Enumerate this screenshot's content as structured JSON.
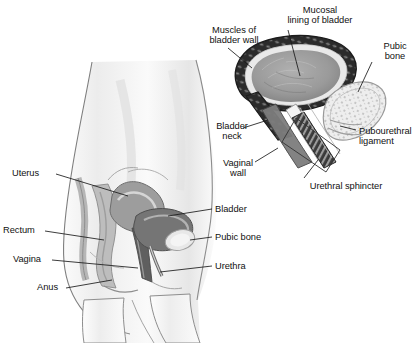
{
  "figure": {
    "background_color": "#ffffff",
    "label_color": "#111111",
    "leader_line_color": "#1a1a1a"
  },
  "main_diagram": {
    "name": "sagittal-female-pelvis",
    "description": "Side view of female torso showing pelvic organs in sagittal section",
    "labels_left": [
      {
        "id": "uterus",
        "text": "Uterus",
        "x": 12,
        "y": 168
      },
      {
        "id": "rectum",
        "text": "Rectum",
        "x": 3,
        "y": 225
      },
      {
        "id": "vagina",
        "text": "Vagina",
        "x": 13,
        "y": 254
      },
      {
        "id": "anus",
        "text": "Anus",
        "x": 37,
        "y": 282
      }
    ],
    "labels_right": [
      {
        "id": "bladder",
        "text": "Bladder",
        "x": 215,
        "y": 204
      },
      {
        "id": "pubic-bone",
        "text": "Pubic bone",
        "x": 215,
        "y": 232
      },
      {
        "id": "urethra",
        "text": "Urethra",
        "x": 215,
        "y": 261
      }
    ],
    "structure_colors": {
      "skin": "#f3f3f3",
      "body_outline": "#8a8a8a",
      "uterus": "#9d9d9d",
      "bladder": "#707070",
      "vagina": "#5f5f5f",
      "rectum": "#b4b4b4",
      "pubic_bone": "#e2e2e2"
    }
  },
  "inset_diagram": {
    "name": "bladder-urethra-detail",
    "description": "Enlarged cross-section of bladder, bladder neck, urethra and supporting ligament",
    "labels": [
      {
        "id": "muscles-of-bladder-wall",
        "text": "Muscles of\nbladder wall",
        "x": 196,
        "y": 25,
        "align": "center"
      },
      {
        "id": "mucosal-lining-of-bladder",
        "text": "Mucosal\nlining of bladder",
        "x": 272,
        "y": 5,
        "align": "center"
      },
      {
        "id": "pubic-bone-inset",
        "text": "Pubic\nbone",
        "x": 377,
        "y": 41,
        "align": "center"
      },
      {
        "id": "pubourethral-ligament",
        "text": "Pubourethral\nligament",
        "x": 359,
        "y": 126,
        "align": "left"
      },
      {
        "id": "bladder-neck",
        "text": "Bladder\nneck",
        "x": 213,
        "y": 121,
        "align": "center"
      },
      {
        "id": "vaginal-wall",
        "text": "Vaginal\nwall",
        "x": 223,
        "y": 158,
        "align": "center"
      },
      {
        "id": "urethral-sphincter",
        "text": "Urethral sphincter",
        "x": 300,
        "y": 181,
        "align": "center"
      }
    ],
    "structure_colors": {
      "bladder_muscle_wall": "#2e2e2e",
      "bladder_mucosa": "#e8e8e8",
      "bladder_lumen": "#9a9a9a",
      "pubic_bone": "#ececec",
      "vaginal_wall": "#808080",
      "urethra_channel": "#f5f5f5",
      "sphincter_box_outline": "#333333"
    }
  }
}
